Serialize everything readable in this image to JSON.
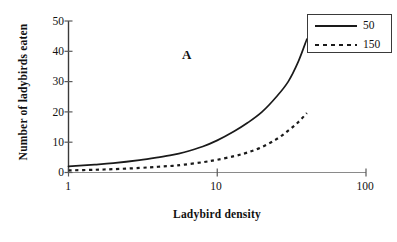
{
  "chart_data": {
    "type": "line",
    "title": "",
    "panel_label": "A",
    "xlabel": "Ladybird density",
    "ylabel": "Number of ladybirds eaten",
    "xscale": "log",
    "xlim": [
      1,
      100
    ],
    "ylim": [
      0,
      50
    ],
    "xticks": [
      1,
      10,
      100
    ],
    "xtick_labels": [
      "1",
      "10",
      "100"
    ],
    "yticks": [
      0,
      10,
      20,
      30,
      40,
      50
    ],
    "ytick_labels": [
      "0",
      "10",
      "20",
      "30",
      "40",
      "50"
    ],
    "grid": false,
    "legend_position": "top-right",
    "series": [
      {
        "name": "50",
        "style": "solid",
        "color": "#1a1a1a",
        "x": [
          1,
          1.5,
          2,
          3,
          4,
          5,
          6,
          8,
          10,
          13,
          16,
          20,
          25,
          30,
          35,
          40
        ],
        "values": [
          2.0,
          2.6,
          3.1,
          4.1,
          5.0,
          5.8,
          6.7,
          8.6,
          10.6,
          13.6,
          16.4,
          20.0,
          25.0,
          30.0,
          36.5,
          44.0
        ]
      },
      {
        "name": "150",
        "style": "dashed",
        "color": "#1a1a1a",
        "x": [
          1,
          1.5,
          2,
          3,
          4,
          5,
          6,
          8,
          10,
          13,
          16,
          20,
          25,
          30,
          35,
          40
        ],
        "values": [
          0.7,
          0.9,
          1.1,
          1.5,
          1.9,
          2.2,
          2.6,
          3.4,
          4.2,
          5.4,
          6.6,
          8.4,
          11.0,
          13.8,
          16.6,
          19.6
        ]
      }
    ]
  },
  "legend": {
    "entries": [
      {
        "label": "50",
        "sample": "solid-line-sample"
      },
      {
        "label": "150",
        "sample": "dashed-line-sample"
      }
    ]
  }
}
